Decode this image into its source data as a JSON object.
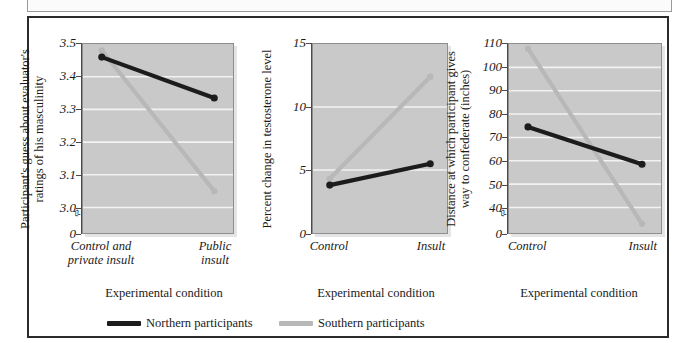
{
  "figure": {
    "legend": {
      "items": [
        {
          "label": "Northern participants",
          "color": "#1c1c1c",
          "key": "northern"
        },
        {
          "label": "Southern participants",
          "color": "#b8b8b8",
          "key": "southern"
        }
      ]
    }
  },
  "chart_data": [
    {
      "type": "line",
      "panel": 1,
      "title": "",
      "xlabel": "Experimental condition",
      "ylabel": "Participant's guess about evaluator's\nratings of his masculinity",
      "categories": [
        "Control and\nprivate insult",
        "Public\ninsult"
      ],
      "tick_labels": [
        "0",
        "3.0",
        "3.1",
        "3.2",
        "3.3",
        "3.4",
        "3.5"
      ],
      "ytick_values": [
        0,
        3.0,
        3.1,
        3.2,
        3.3,
        3.4,
        3.5
      ],
      "ylim": [
        3.0,
        3.5
      ],
      "axis_break": true,
      "grid": true,
      "series": [
        {
          "name": "Northern participants",
          "color": "#1c1c1c",
          "values": [
            3.46,
            3.335
          ]
        },
        {
          "name": "Southern participants",
          "color": "#b8b8b8",
          "values": [
            3.48,
            3.05
          ]
        }
      ]
    },
    {
      "type": "line",
      "panel": 2,
      "title": "",
      "xlabel": "Experimental condition",
      "ylabel": "Percent change in testosterone level",
      "categories": [
        "Control",
        "Insult"
      ],
      "tick_labels": [
        "0",
        "5",
        "10",
        "15"
      ],
      "ytick_values": [
        0,
        5,
        10,
        15
      ],
      "ylim": [
        0,
        15
      ],
      "axis_break": false,
      "grid": true,
      "series": [
        {
          "name": "Northern participants",
          "color": "#1c1c1c",
          "values": [
            3.8,
            5.5
          ]
        },
        {
          "name": "Southern participants",
          "color": "#b8b8b8",
          "values": [
            4.3,
            12.4
          ]
        }
      ]
    },
    {
      "type": "line",
      "panel": 3,
      "title": "",
      "xlabel": "Experimental condition",
      "ylabel": "Distance at which participant gives\nway to confederate (inches)",
      "categories": [
        "Control",
        "Insult"
      ],
      "tick_labels": [
        "0",
        "40",
        "50",
        "60",
        "70",
        "80",
        "90",
        "100",
        "110"
      ],
      "ytick_values": [
        0,
        40,
        50,
        60,
        70,
        80,
        90,
        100,
        110
      ],
      "ylim": [
        40,
        110
      ],
      "axis_break": true,
      "grid": true,
      "series": [
        {
          "name": "Northern participants",
          "color": "#1c1c1c",
          "values": [
            74.5,
            58.5
          ]
        },
        {
          "name": "Southern participants",
          "color": "#b8b8b8",
          "values": [
            108,
            33
          ]
        }
      ]
    }
  ]
}
